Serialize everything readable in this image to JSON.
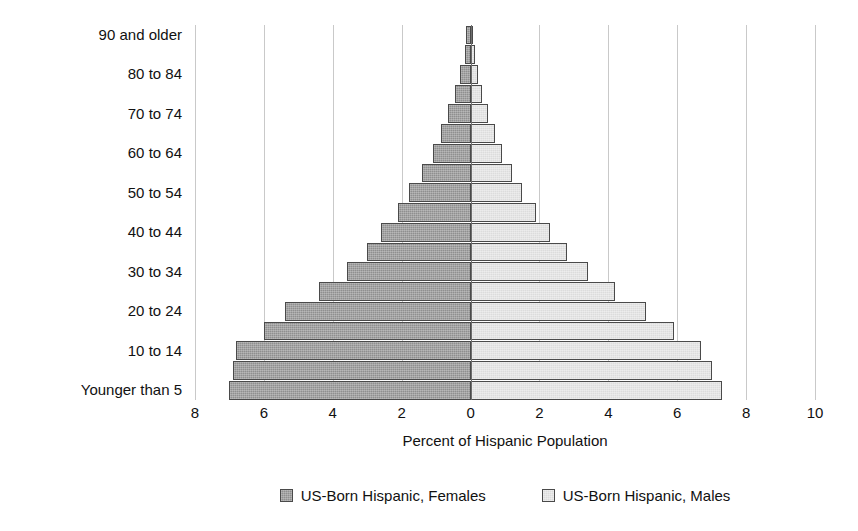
{
  "chart_data": {
    "type": "bar",
    "subtype": "population-pyramid",
    "title": "",
    "xlabel": "Percent of Hispanic Population",
    "ylabel": "",
    "xlim": [
      -8,
      10
    ],
    "x_ticks": [
      -8,
      -6,
      -4,
      -2,
      0,
      2,
      4,
      6,
      8,
      10
    ],
    "x_tick_labels": [
      "8",
      "6",
      "4",
      "2",
      "0",
      "2",
      "4",
      "6",
      "8",
      "10"
    ],
    "grid": "vertical",
    "legend_position": "bottom",
    "categories": [
      "Younger than 5",
      "5 to 9",
      "10 to 14",
      "15 to 19",
      "20 to 24",
      "25 to 29",
      "30 to 34",
      "35 to 39",
      "40 to 44",
      "45 to 49",
      "50 to 54",
      "55 to 59",
      "60 to 64",
      "65 to 69",
      "70 to 74",
      "75 to 79",
      "80 to 84",
      "85 to 89",
      "90 and older"
    ],
    "y_tick_labels": [
      "Younger than 5",
      "",
      "10 to 14",
      "",
      "20 to 24",
      "",
      "30 to 34",
      "",
      "40 to 44",
      "",
      "50 to 54",
      "",
      "60 to 64",
      "",
      "70 to 74",
      "",
      "80 to 84",
      "",
      "90 and older"
    ],
    "series": [
      {
        "name": "US-Born Hispanic, Females",
        "side": "left",
        "color": "#8f8f8f",
        "values": [
          7.0,
          6.9,
          6.8,
          6.0,
          5.4,
          4.4,
          3.6,
          3.0,
          2.6,
          2.1,
          1.8,
          1.4,
          1.1,
          0.85,
          0.65,
          0.45,
          0.3,
          0.17,
          0.12
        ]
      },
      {
        "name": "US-Born Hispanic, Males",
        "side": "right",
        "color": "#dcdcdc",
        "values": [
          7.3,
          7.0,
          6.7,
          5.9,
          5.1,
          4.2,
          3.4,
          2.8,
          2.3,
          1.9,
          1.5,
          1.2,
          0.9,
          0.7,
          0.5,
          0.34,
          0.22,
          0.12,
          0.08
        ]
      }
    ]
  },
  "legend": {
    "items": [
      {
        "label": "US-Born Hispanic, Females",
        "swatch": "female-swatch"
      },
      {
        "label": "US-Born Hispanic, Males",
        "swatch": "male-swatch"
      }
    ]
  }
}
